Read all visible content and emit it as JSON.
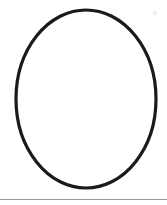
{
  "canvas": {
    "width": 167,
    "height": 205,
    "background_color": "#ffffff",
    "title": "Ellipse Outline Drawing"
  },
  "shapes": {
    "ellipse": {
      "name": "ellipse-outline",
      "center_x": 86,
      "center_y": 99,
      "radius_x": 70,
      "radius_y": 89,
      "stroke_color": "#1a1a1a",
      "stroke_width": 3.2,
      "fill": "none",
      "label": "Ellipse"
    },
    "divider": {
      "name": "horizontal-divider",
      "x1": 0,
      "y1": 199.5,
      "x2": 167,
      "y2": 199.5,
      "stroke_color": "#9a9a9a",
      "stroke_width": 1,
      "label": "Horizontal rule"
    },
    "speck": {
      "name": "stray-speck",
      "center_x": 155,
      "center_y": 13,
      "radius": 2.2,
      "fill_color": "#ededed",
      "label": "Faint speck"
    }
  }
}
